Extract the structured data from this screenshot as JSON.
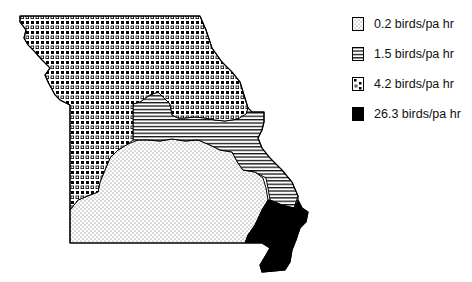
{
  "map": {
    "title": "",
    "region": "Missouri",
    "zones": [
      {
        "id": "zone-south",
        "value": 0.2,
        "pattern": "fine-dots"
      },
      {
        "id": "zone-central-east",
        "value": 1.5,
        "pattern": "horizontal-lines"
      },
      {
        "id": "zone-north-west",
        "value": 4.2,
        "pattern": "large-dots"
      },
      {
        "id": "zone-southeast",
        "value": 26.3,
        "pattern": "solid-black"
      }
    ]
  },
  "legend": {
    "items": [
      {
        "label": "0.2 birds/pa hr",
        "pattern": "fine-dots"
      },
      {
        "label": "1.5 birds/pa hr",
        "pattern": "horizontal-lines"
      },
      {
        "label": "4.2 birds/pa hr",
        "pattern": "large-dots"
      },
      {
        "label": "26.3 birds/pa hr",
        "pattern": "solid-black"
      }
    ]
  },
  "colors": {
    "ink": "#000000",
    "background": "#ffffff"
  }
}
